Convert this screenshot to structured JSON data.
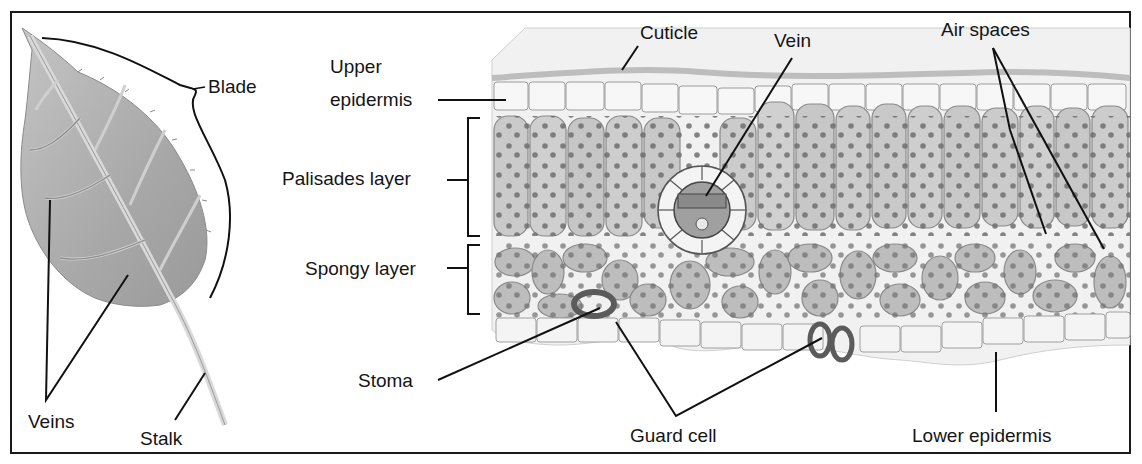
{
  "diagram": {
    "leaf_panel": {
      "labels": {
        "blade": "Blade",
        "veins": "Veins",
        "stalk": "Stalk"
      }
    },
    "cross_section_panel": {
      "labels": {
        "upper_epidermis_line1": "Upper",
        "upper_epidermis_line2": "epidermis",
        "cuticle": "Cuticle",
        "vein": "Vein",
        "air_spaces": "Air spaces",
        "palisades_layer": "Palisades layer",
        "spongy_layer": "Spongy layer",
        "stoma": "Stoma",
        "guard_cell": "Guard cell",
        "lower_epidermis": "Lower epidermis"
      }
    },
    "colors": {
      "frame": "#1a1a1a",
      "leaf_fill": "#a9a9a9",
      "leaf_vein": "#d6d6d6",
      "cell_fill": "#c9c9c9",
      "cell_stroke": "#7a7a7a",
      "chloroplast": "#6f6f6f",
      "epidermis": "#ececec",
      "guard_cell": "#5b5b5b"
    }
  }
}
